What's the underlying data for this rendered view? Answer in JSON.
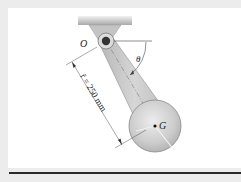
{
  "figure": {
    "pivot_label": "O",
    "angle_label": "θ",
    "center_label": "G",
    "dimension_label": "r̄ = 250 mm"
  },
  "colors": {
    "background": "#ececec",
    "panel": "#ffffff",
    "rule": "#2a2a2a",
    "bar_fill": "#c9c9c9",
    "disk_fill": "#cfcfcf",
    "pin": "#333333"
  }
}
